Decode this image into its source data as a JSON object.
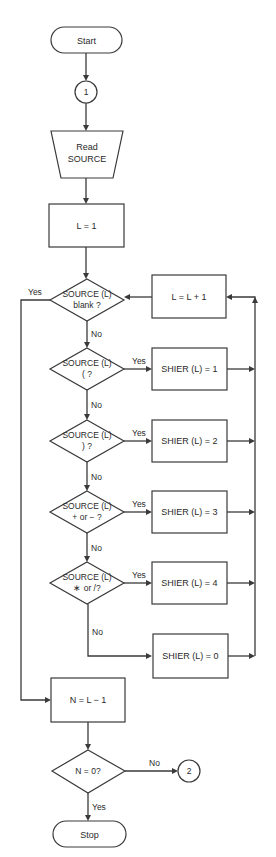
{
  "diagram": {
    "type": "flowchart",
    "nodes": {
      "start": {
        "label": "Start",
        "shape": "terminal"
      },
      "connector1": {
        "label": "1",
        "shape": "connector"
      },
      "read": {
        "line1": "Read",
        "line2": "SOURCE",
        "shape": "manual-input"
      },
      "init": {
        "label": "L = 1",
        "shape": "process"
      },
      "d_blank": {
        "line1": "SOURCE (L)",
        "line2": "blank ?",
        "shape": "decision"
      },
      "incr": {
        "label": "L = L + 1",
        "shape": "process"
      },
      "d_lparen": {
        "line1": "SOURCE (L)",
        "line2": "( ?",
        "shape": "decision"
      },
      "s1": {
        "label": "SHIER (L) = 1",
        "shape": "process"
      },
      "d_rparen": {
        "line1": "SOURCE (L)",
        "line2": ") ?",
        "shape": "decision"
      },
      "s2": {
        "label": "SHIER (L) = 2",
        "shape": "process"
      },
      "d_plusminus": {
        "line1": "SOURCE (L)",
        "line2": "+ or − ?",
        "shape": "decision"
      },
      "s3": {
        "label": "SHIER (L) = 3",
        "shape": "process"
      },
      "d_muldiv": {
        "line1": "SOURCE (L)",
        "line2": "∗ or /?",
        "shape": "decision"
      },
      "s4": {
        "label": "SHIER (L) = 4",
        "shape": "process"
      },
      "s0": {
        "label": "SHIER (L) = 0",
        "shape": "process"
      },
      "count": {
        "label": "N = L − 1",
        "shape": "process"
      },
      "d_zero": {
        "label": "N = 0?",
        "shape": "decision"
      },
      "connector2": {
        "label": "2",
        "shape": "connector"
      },
      "stop": {
        "label": "Stop",
        "shape": "terminal"
      }
    },
    "edge_labels": {
      "yes": "Yes",
      "no": "No"
    },
    "colors": {
      "stroke": "#3a3a3a",
      "background": "#ffffff",
      "text": "#2a2a2a"
    }
  }
}
